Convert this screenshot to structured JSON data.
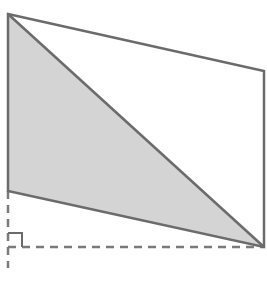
{
  "diagram": {
    "type": "geometry",
    "colors": {
      "stroke": "#6b6b6b",
      "fill_shaded": "#d4d4d4",
      "background": "#ffffff",
      "dashed": "#7a7a7a"
    },
    "parallelogram": {
      "vertices": [
        {
          "label": "",
          "x": 8,
          "y": 14
        },
        {
          "label": "",
          "x": 264,
          "y": 71
        },
        {
          "label": "",
          "x": 264,
          "y": 247
        },
        {
          "label": "",
          "x": 8,
          "y": 191
        }
      ]
    },
    "shaded_triangle": {
      "vertices": [
        {
          "x": 8,
          "y": 14
        },
        {
          "x": 8,
          "y": 191
        },
        {
          "x": 264,
          "y": 247
        }
      ]
    },
    "diagonal": {
      "x1": 8,
      "y1": 14,
      "x2": 264,
      "y2": 247
    },
    "dashed_lines": [
      {
        "name": "vertical-extension",
        "x1": 8,
        "y1": 191,
        "x2": 8,
        "y2": 268
      },
      {
        "name": "horizontal-base",
        "x1": 8,
        "y1": 247,
        "x2": 264,
        "y2": 247
      }
    ],
    "right_angle_marker": {
      "x": 8,
      "y": 233,
      "size": 14
    }
  }
}
